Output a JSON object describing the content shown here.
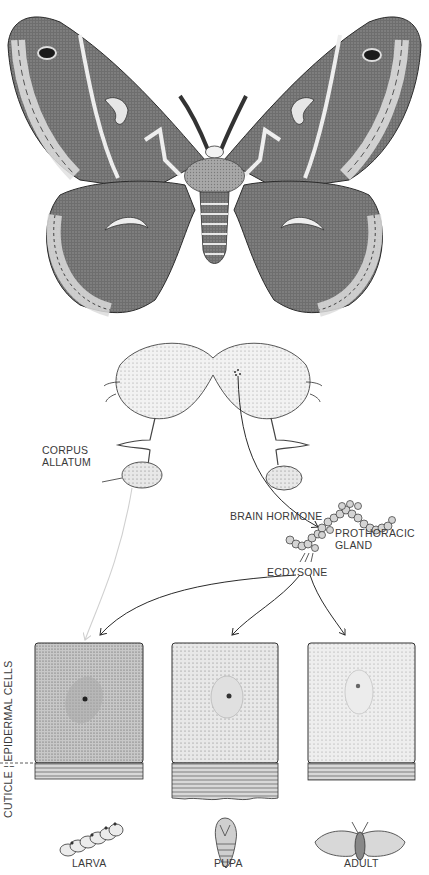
{
  "figure": {
    "title_moth": "Cecropia moth (adult, dorsal view)",
    "labels": {
      "corpus_allatum_line1": "CORPUS",
      "corpus_allatum_line2": "ALLATUM",
      "brain_hormone": "BRAIN HORMONE",
      "prothoracic_line1": "PROTHORACIC",
      "prothoracic_line2": "GLAND",
      "ecdysone": "ECDYSONE",
      "side_axis": "CUTICLE ¦ EPIDERMAL CELLS"
    },
    "stages": [
      {
        "label": "LARVA",
        "cell_shade": "#b8b8b8",
        "cuticle_height": 30
      },
      {
        "label": "PUPA",
        "cell_shade": "#dcdcdc",
        "cuticle_height": 48
      },
      {
        "label": "ADULT",
        "cell_shade": "#e4e4e4",
        "cuticle_height": 30
      }
    ],
    "colors": {
      "ink": "#2b2b2b",
      "stipple_dark": "#7a7a7a",
      "wing_dark": "#5a5a5a",
      "wing_light": "#d8d8d8",
      "faint_arrow": "#d0d0d0"
    }
  }
}
